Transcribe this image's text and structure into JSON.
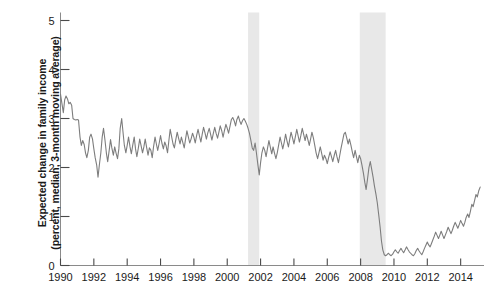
{
  "chart_data": {
    "type": "line",
    "title": "",
    "xlabel": "",
    "ylabel_line1": "Expected change in family income",
    "ylabel_line2": "(percent, median, 3-month moving average)",
    "xlim": [
      1990.0,
      2015.4
    ],
    "ylim": [
      0,
      5
    ],
    "xticks": [
      1990,
      1992,
      1994,
      1996,
      1998,
      2000,
      2002,
      2004,
      2006,
      2008,
      2010,
      2012,
      2014
    ],
    "xtick_labels": [
      "1990",
      "1992",
      "1994",
      "1996",
      "1998",
      "2000",
      "2002",
      "2004",
      "2006",
      "2008",
      "2010",
      "2012",
      "2014"
    ],
    "yticks": [
      0,
      1,
      2,
      3,
      4,
      5
    ],
    "ytick_labels": [
      "0",
      "1",
      "2",
      "3",
      "4",
      "5"
    ],
    "grid": false,
    "legend": "none",
    "line_color": "#7d7d7d",
    "line_width": 1.1,
    "shaded_bands": [
      {
        "name": "recession-2001",
        "start": 2001.25,
        "end": 2001.92,
        "color": "#e8e8e8"
      },
      {
        "name": "recession-2008",
        "start": 2007.95,
        "end": 2009.5,
        "color": "#e8e8e8"
      }
    ],
    "series": [
      {
        "name": "Expected change in family income",
        "x": [
          1990.0,
          1990.08,
          1990.17,
          1990.25,
          1990.33,
          1990.42,
          1990.5,
          1990.58,
          1990.67,
          1990.75,
          1990.83,
          1990.92,
          1991.0,
          1991.08,
          1991.17,
          1991.25,
          1991.33,
          1991.42,
          1991.5,
          1991.58,
          1991.67,
          1991.75,
          1991.83,
          1991.92,
          1992.0,
          1992.08,
          1992.17,
          1992.25,
          1992.33,
          1992.42,
          1992.5,
          1992.58,
          1992.67,
          1992.75,
          1992.83,
          1992.92,
          1993.0,
          1993.08,
          1993.17,
          1993.25,
          1993.33,
          1993.42,
          1993.5,
          1993.58,
          1993.67,
          1993.75,
          1993.83,
          1993.92,
          1994.0,
          1994.08,
          1994.17,
          1994.25,
          1994.33,
          1994.42,
          1994.5,
          1994.58,
          1994.67,
          1994.75,
          1994.83,
          1994.92,
          1995.0,
          1995.08,
          1995.17,
          1995.25,
          1995.33,
          1995.42,
          1995.5,
          1995.58,
          1995.67,
          1995.75,
          1995.83,
          1995.92,
          1996.0,
          1996.08,
          1996.17,
          1996.25,
          1996.33,
          1996.42,
          1996.5,
          1996.58,
          1996.67,
          1996.75,
          1996.83,
          1996.92,
          1997.0,
          1997.08,
          1997.17,
          1997.25,
          1997.33,
          1997.42,
          1997.5,
          1997.58,
          1997.67,
          1997.75,
          1997.83,
          1997.92,
          1998.0,
          1998.08,
          1998.17,
          1998.25,
          1998.33,
          1998.42,
          1998.5,
          1998.58,
          1998.67,
          1998.75,
          1998.83,
          1998.92,
          1999.0,
          1999.08,
          1999.17,
          1999.25,
          1999.33,
          1999.42,
          1999.5,
          1999.58,
          1999.67,
          1999.75,
          1999.83,
          1999.92,
          2000.0,
          2000.08,
          2000.17,
          2000.25,
          2000.33,
          2000.42,
          2000.5,
          2000.58,
          2000.67,
          2000.75,
          2000.83,
          2000.92,
          2001.0,
          2001.08,
          2001.17,
          2001.25,
          2001.33,
          2001.42,
          2001.5,
          2001.58,
          2001.67,
          2001.75,
          2001.83,
          2001.92,
          2002.0,
          2002.08,
          2002.17,
          2002.25,
          2002.33,
          2002.42,
          2002.5,
          2002.58,
          2002.67,
          2002.75,
          2002.83,
          2002.92,
          2003.0,
          2003.08,
          2003.17,
          2003.25,
          2003.33,
          2003.42,
          2003.5,
          2003.58,
          2003.67,
          2003.75,
          2003.83,
          2003.92,
          2004.0,
          2004.08,
          2004.17,
          2004.25,
          2004.33,
          2004.42,
          2004.5,
          2004.58,
          2004.67,
          2004.75,
          2004.83,
          2004.92,
          2005.0,
          2005.08,
          2005.17,
          2005.25,
          2005.33,
          2005.42,
          2005.5,
          2005.58,
          2005.67,
          2005.75,
          2005.83,
          2005.92,
          2006.0,
          2006.08,
          2006.17,
          2006.25,
          2006.33,
          2006.42,
          2006.5,
          2006.58,
          2006.67,
          2006.75,
          2006.83,
          2006.92,
          2007.0,
          2007.08,
          2007.17,
          2007.25,
          2007.33,
          2007.42,
          2007.5,
          2007.58,
          2007.67,
          2007.75,
          2007.83,
          2007.92,
          2008.0,
          2008.08,
          2008.17,
          2008.25,
          2008.33,
          2008.42,
          2008.5,
          2008.58,
          2008.67,
          2008.75,
          2008.83,
          2008.92,
          2009.0,
          2009.08,
          2009.17,
          2009.25,
          2009.33,
          2009.42,
          2009.5,
          2009.58,
          2009.67,
          2009.75,
          2009.83,
          2009.92,
          2010.0,
          2010.08,
          2010.17,
          2010.25,
          2010.33,
          2010.42,
          2010.5,
          2010.58,
          2010.67,
          2010.75,
          2010.83,
          2010.92,
          2011.0,
          2011.08,
          2011.17,
          2011.25,
          2011.33,
          2011.42,
          2011.5,
          2011.58,
          2011.67,
          2011.75,
          2011.83,
          2011.92,
          2012.0,
          2012.08,
          2012.17,
          2012.25,
          2012.33,
          2012.42,
          2012.5,
          2012.58,
          2012.67,
          2012.75,
          2012.83,
          2012.92,
          2013.0,
          2013.08,
          2013.17,
          2013.25,
          2013.33,
          2013.42,
          2013.5,
          2013.58,
          2013.67,
          2013.75,
          2013.83,
          2013.92,
          2014.0,
          2014.08,
          2014.17,
          2014.25,
          2014.33,
          2014.42,
          2014.5,
          2014.58,
          2014.67,
          2014.75,
          2014.83,
          2014.92,
          2015.0,
          2015.08,
          2015.17
        ],
        "y": [
          3.5,
          3.32,
          3.12,
          3.38,
          3.46,
          3.4,
          3.3,
          3.33,
          3.27,
          3.0,
          2.98,
          2.97,
          2.98,
          2.97,
          2.62,
          2.45,
          2.55,
          2.47,
          2.3,
          2.2,
          2.35,
          2.62,
          2.68,
          2.58,
          2.38,
          2.2,
          2.05,
          1.8,
          2.05,
          2.3,
          2.62,
          2.8,
          2.55,
          2.3,
          2.12,
          2.35,
          2.57,
          2.4,
          2.25,
          2.42,
          2.3,
          2.18,
          2.38,
          2.8,
          3.0,
          2.72,
          2.45,
          2.3,
          2.45,
          2.62,
          2.42,
          2.28,
          2.45,
          2.62,
          2.38,
          2.22,
          2.4,
          2.58,
          2.45,
          2.3,
          2.42,
          2.58,
          2.4,
          2.25,
          2.4,
          2.35,
          2.2,
          2.42,
          2.62,
          2.48,
          2.35,
          2.5,
          2.65,
          2.5,
          2.38,
          2.52,
          2.45,
          2.3,
          2.55,
          2.78,
          2.62,
          2.48,
          2.4,
          2.58,
          2.72,
          2.6,
          2.48,
          2.62,
          2.52,
          2.4,
          2.58,
          2.75,
          2.62,
          2.5,
          2.58,
          2.7,
          2.62,
          2.5,
          2.66,
          2.78,
          2.65,
          2.52,
          2.68,
          2.82,
          2.7,
          2.58,
          2.7,
          2.8,
          2.68,
          2.56,
          2.7,
          2.82,
          2.7,
          2.6,
          2.72,
          2.85,
          2.75,
          2.62,
          2.75,
          2.88,
          2.8,
          2.7,
          2.85,
          2.98,
          3.02,
          2.95,
          2.85,
          2.98,
          3.05,
          2.95,
          2.88,
          2.96,
          3.0,
          2.95,
          2.88,
          2.8,
          2.7,
          2.55,
          2.4,
          2.35,
          2.5,
          2.3,
          2.08,
          1.85,
          2.1,
          2.3,
          2.42,
          2.35,
          2.22,
          2.4,
          2.55,
          2.42,
          2.28,
          2.42,
          2.3,
          2.18,
          2.3,
          2.45,
          2.62,
          2.5,
          2.38,
          2.52,
          2.68,
          2.55,
          2.42,
          2.58,
          2.72,
          2.6,
          2.48,
          2.62,
          2.78,
          2.65,
          2.52,
          2.66,
          2.8,
          2.68,
          2.55,
          2.68,
          2.58,
          2.45,
          2.58,
          2.72,
          2.6,
          2.45,
          2.3,
          2.18,
          2.3,
          2.42,
          2.28,
          2.15,
          2.25,
          2.18,
          2.08,
          2.2,
          2.32,
          2.22,
          2.12,
          2.25,
          2.35,
          2.22,
          2.1,
          2.25,
          2.4,
          2.55,
          2.68,
          2.72,
          2.6,
          2.48,
          2.58,
          2.45,
          2.32,
          2.2,
          2.35,
          2.22,
          2.1,
          2.25,
          2.18,
          2.05,
          1.88,
          1.7,
          1.55,
          1.78,
          2.0,
          2.12,
          1.95,
          1.8,
          1.62,
          1.45,
          1.28,
          1.05,
          0.78,
          0.5,
          0.32,
          0.22,
          0.2,
          0.22,
          0.25,
          0.22,
          0.2,
          0.23,
          0.28,
          0.32,
          0.28,
          0.25,
          0.3,
          0.35,
          0.3,
          0.26,
          0.32,
          0.38,
          0.33,
          0.28,
          0.25,
          0.22,
          0.2,
          0.24,
          0.3,
          0.35,
          0.3,
          0.26,
          0.22,
          0.28,
          0.35,
          0.42,
          0.48,
          0.42,
          0.38,
          0.45,
          0.52,
          0.6,
          0.68,
          0.62,
          0.55,
          0.62,
          0.7,
          0.62,
          0.55,
          0.62,
          0.7,
          0.78,
          0.72,
          0.65,
          0.72,
          0.8,
          0.88,
          0.82,
          0.76,
          0.84,
          0.92,
          0.86,
          0.8,
          0.88,
          0.98,
          1.05,
          0.98,
          1.1,
          1.25,
          1.2,
          1.32,
          1.45,
          1.4,
          1.52,
          1.6
        ]
      }
    ]
  }
}
